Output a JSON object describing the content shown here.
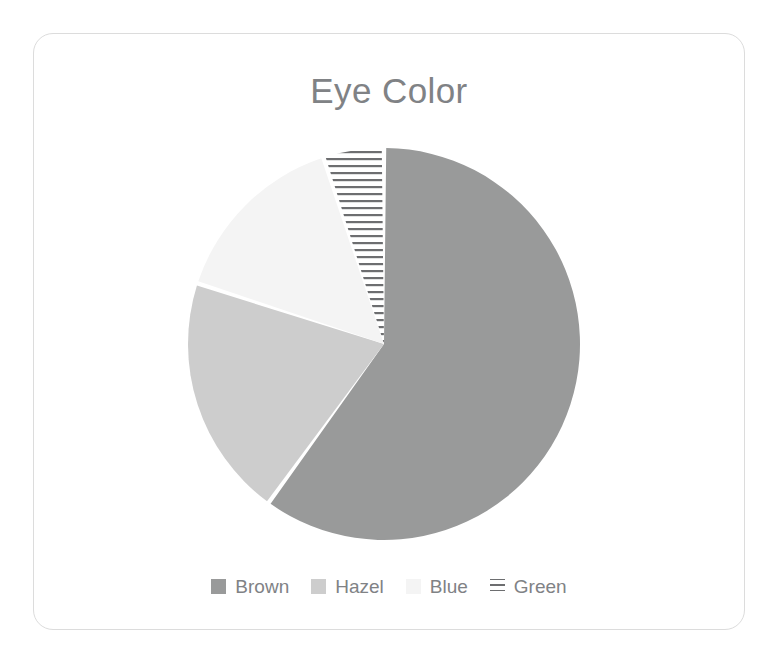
{
  "card": {
    "border_color": "#dcdcdc",
    "background": "#ffffff"
  },
  "chart_data": {
    "type": "pie",
    "title": "Eye Color",
    "xlabel": "",
    "ylabel": "",
    "categories": [
      "Brown",
      "Hazel",
      "Blue",
      "Green"
    ],
    "values": [
      60,
      20,
      15,
      5
    ],
    "units": "percent",
    "start_angle_deg": 0,
    "direction": "clockwise",
    "legend_position": "bottom",
    "grid": false,
    "slices": [
      {
        "label": "Brown",
        "value": 60,
        "percent": 60,
        "color": "#999a9a",
        "pattern": "solid",
        "start_angle_deg": 0,
        "end_angle_deg": 216
      },
      {
        "label": "Hazel",
        "value": 20,
        "percent": 20,
        "color": "#cdcdcd",
        "pattern": "solid",
        "start_angle_deg": 216,
        "end_angle_deg": 288
      },
      {
        "label": "Blue",
        "value": 15,
        "percent": 15,
        "color": "#f4f4f4",
        "pattern": "solid",
        "start_angle_deg": 288,
        "end_angle_deg": 342
      },
      {
        "label": "Green",
        "value": 5,
        "percent": 5,
        "color": "#ffffff",
        "pattern": "horizontal-lines",
        "pattern_color": "#6d6e70",
        "start_angle_deg": 342,
        "end_angle_deg": 360
      }
    ]
  },
  "legend": {
    "items": [
      {
        "label": "Brown",
        "swatch_color": "#999a9a",
        "pattern": "solid"
      },
      {
        "label": "Hazel",
        "swatch_color": "#cdcdcd",
        "pattern": "solid"
      },
      {
        "label": "Blue",
        "swatch_color": "#f4f4f4",
        "pattern": "solid"
      },
      {
        "label": "Green",
        "swatch_color": "#ffffff",
        "pattern": "horizontal-lines"
      }
    ],
    "text_color": "#808285"
  },
  "title_color": "#808285"
}
